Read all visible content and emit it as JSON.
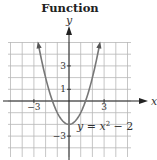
{
  "title": "Function",
  "chart_data": {
    "type": "line",
    "title": "Function",
    "xlabel": "x",
    "ylabel": "y",
    "equation_label": "y = x² − 2",
    "equation": "y = x^2 - 2",
    "xlim": [
      -5,
      5
    ],
    "ylim": [
      -5,
      5
    ],
    "grid": true,
    "x_ticks_labeled": [
      -3,
      3
    ],
    "y_ticks_labeled": [
      3,
      1,
      -3
    ],
    "tick_labels": {
      "x_neg3": "−3",
      "x_pos3": "3",
      "y_pos3": "3",
      "y_pos1": "1",
      "y_neg3": "−3"
    },
    "series": [
      {
        "name": "y = x^2 - 2",
        "x": [
          -2.6,
          -2,
          -1.5,
          -1,
          -0.5,
          0,
          0.5,
          1,
          1.5,
          2,
          2.6
        ],
        "y": [
          4.76,
          2,
          0.25,
          -1,
          -1.75,
          -2,
          -1.75,
          -1,
          0.25,
          2,
          4.76
        ]
      }
    ],
    "vertex": [
      0,
      -2
    ],
    "arrows_on_ends": true
  },
  "colors": {
    "grid": "#b8b8b8",
    "axis": "#222222",
    "curve": "#777777",
    "text": "#333333"
  }
}
